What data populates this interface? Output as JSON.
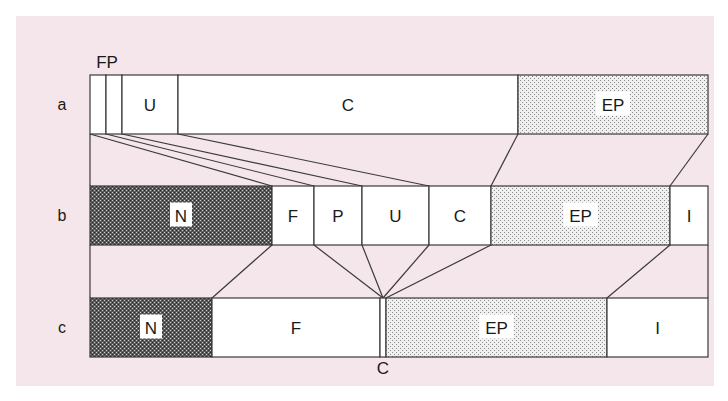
{
  "diagram": {
    "type": "segment-mapping",
    "rows": [
      {
        "id": "a",
        "label": "a",
        "segments": [
          {
            "name": "F",
            "x0": 90,
            "x1": 106,
            "fill": "white",
            "show_label": false
          },
          {
            "name": "P",
            "x0": 106,
            "x1": 122,
            "fill": "white",
            "show_label": false
          },
          {
            "name": "U",
            "x0": 122,
            "x1": 178,
            "fill": "white",
            "show_label": true
          },
          {
            "name": "C",
            "x0": 178,
            "x1": 518,
            "fill": "white",
            "show_label": true
          },
          {
            "name": "EP",
            "x0": 518,
            "x1": 708,
            "fill": "light-stipple",
            "show_label": true
          }
        ],
        "above_label": "FP"
      },
      {
        "id": "b",
        "label": "b",
        "segments": [
          {
            "name": "N",
            "x0": 90,
            "x1": 272,
            "fill": "dark-stipple",
            "show_label": true
          },
          {
            "name": "F",
            "x0": 272,
            "x1": 314,
            "fill": "white",
            "show_label": true
          },
          {
            "name": "P",
            "x0": 314,
            "x1": 362,
            "fill": "white",
            "show_label": true
          },
          {
            "name": "U",
            "x0": 362,
            "x1": 429,
            "fill": "white",
            "show_label": true
          },
          {
            "name": "C",
            "x0": 429,
            "x1": 491,
            "fill": "white",
            "show_label": true
          },
          {
            "name": "EP",
            "x0": 491,
            "x1": 670,
            "fill": "light-stipple",
            "show_label": true
          },
          {
            "name": "I",
            "x0": 670,
            "x1": 708,
            "fill": "white",
            "show_label": true
          }
        ]
      },
      {
        "id": "c",
        "label": "c",
        "segments": [
          {
            "name": "N",
            "x0": 90,
            "x1": 212,
            "fill": "dark-stipple",
            "show_label": true
          },
          {
            "name": "F",
            "x0": 212,
            "x1": 380,
            "fill": "white",
            "show_label": true
          },
          {
            "name": "C",
            "x0": 380,
            "x1": 386,
            "fill": "white",
            "show_label": false
          },
          {
            "name": "EP",
            "x0": 386,
            "x1": 607,
            "fill": "light-stipple",
            "show_label": true
          },
          {
            "name": "I",
            "x0": 607,
            "x1": 708,
            "fill": "white",
            "show_label": true
          }
        ],
        "below_label": "C"
      }
    ],
    "colors": {
      "background": "#ffffff",
      "panel": "#f4e6ea",
      "stroke": "#3a3a3a",
      "light_stipple": "#d8d8d8",
      "dark_stipple": "#6a6a6a",
      "text": "#1a1a1a"
    }
  }
}
